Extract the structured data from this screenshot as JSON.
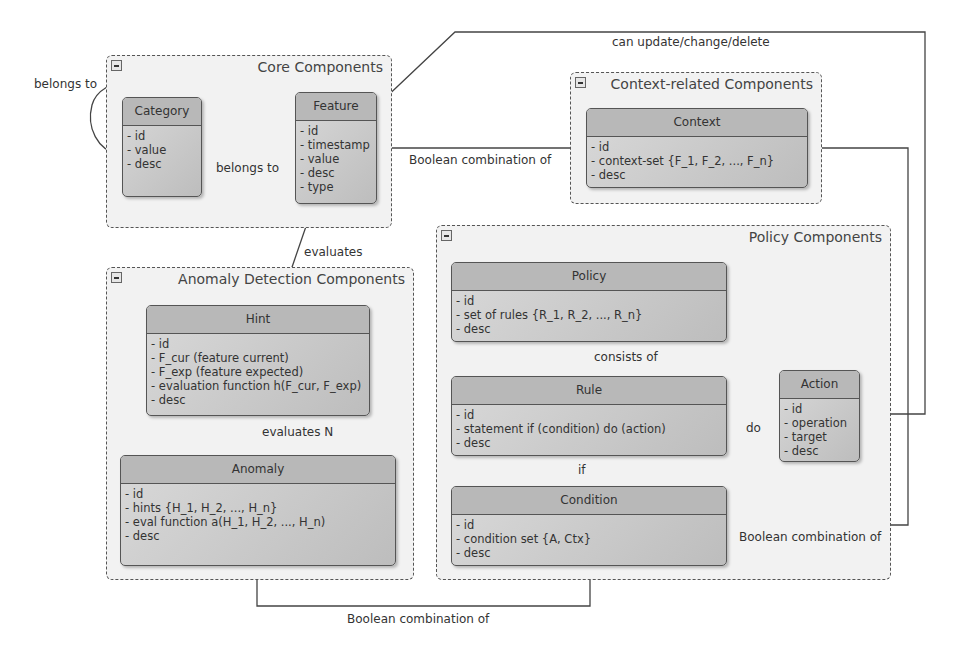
{
  "packages": {
    "core": {
      "title": "Core Components"
    },
    "context": {
      "title": "Context-related Components"
    },
    "anomaly": {
      "title": "Anomaly Detection Components"
    },
    "policy": {
      "title": "Policy Components"
    }
  },
  "classes": {
    "category": {
      "name": "Category",
      "attrs": [
        "- id",
        "- value",
        "- desc"
      ]
    },
    "feature": {
      "name": "Feature",
      "attrs": [
        "- id",
        "- timestamp",
        "- value",
        "- desc",
        "- type"
      ]
    },
    "context": {
      "name": "Context",
      "attrs": [
        "- id",
        "- context-set {F_1, F_2, ..., F_n}",
        "- desc"
      ]
    },
    "hint": {
      "name": "Hint",
      "attrs": [
        "- id",
        "- F_cur (feature current)",
        "- F_exp (feature expected)",
        "- evaluation function h(F_cur, F_exp)",
        "- desc"
      ]
    },
    "anomaly": {
      "name": "Anomaly",
      "attrs": [
        "- id",
        "- hints {H_1, H_2, ..., H_n}",
        "- eval function a(H_1, H_2, ..., H_n)",
        "- desc"
      ]
    },
    "policy": {
      "name": "Policy",
      "attrs": [
        "- id",
        "- set of rules {R_1, R_2, ..., R_n}",
        "- desc"
      ]
    },
    "rule": {
      "name": "Rule",
      "attrs": [
        "- id",
        "- statement if (condition) do (action)",
        "- desc"
      ]
    },
    "condition": {
      "name": "Condition",
      "attrs": [
        "- id",
        "- condition set {A, Ctx}",
        "- desc"
      ]
    },
    "action": {
      "name": "Action",
      "attrs": [
        "- id",
        "- operation",
        "- target",
        "- desc"
      ]
    }
  },
  "edges": {
    "category_self": "belongs to",
    "feature_category": "belongs to",
    "context_feature": "Boolean combination of",
    "action_feature": "can update/change/delete",
    "hint_feature": "evaluates",
    "anomaly_hint": "evaluates N",
    "policy_rule": "consists of",
    "rule_condition": "if",
    "rule_action": "do",
    "condition_context": "Boolean combination of",
    "condition_anomaly": "Boolean combination of"
  },
  "colors": {
    "line": "#444444",
    "class_fill": "#c8c8c8",
    "package_fill": "#f2f2f2"
  }
}
